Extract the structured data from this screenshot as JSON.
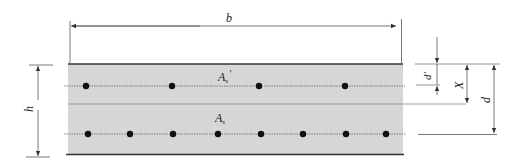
{
  "diagram": {
    "labels": {
      "width": "b",
      "height": "h",
      "compression_steel": "A",
      "compression_steel_sub": "s",
      "compression_steel_prime": "′",
      "tension_steel": "A",
      "tension_steel_sub": "s",
      "cover_compression": "d′",
      "neutral_axis_depth": "X",
      "effective_depth": "d"
    },
    "colors": {
      "section_fill": "#d6d6d6",
      "section_edge": "#333333",
      "rebar": "#111111",
      "dimension_line": "#555555",
      "bar_line": "#666666"
    },
    "compression_bars_count": 4,
    "tension_bars_count": 8
  }
}
